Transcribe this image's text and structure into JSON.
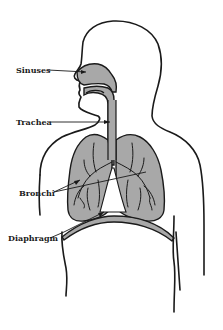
{
  "diagram": {
    "labels": {
      "sinuses": "Sinuses",
      "trachea": "Trachea",
      "bronchi": "Bronchi",
      "diaphragm": "Diaphragm"
    },
    "colors": {
      "outline": "#1a1a1a",
      "organ_fill": "#a8a8a8",
      "background": "#ffffff"
    }
  }
}
